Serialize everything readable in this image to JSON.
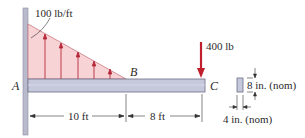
{
  "diagram": {
    "type": "cantilever-beam",
    "support_label": "A",
    "load_end_label": "B",
    "free_end_label": "C",
    "distributed_load": {
      "label": "100 lb/ft",
      "max_at": "A",
      "zero_at": "B"
    },
    "point_load": {
      "label": "400 lb",
      "at": "C",
      "direction": "down"
    },
    "dimensions": {
      "AB": "10 ft",
      "BC": "8 ft"
    },
    "cross_section": {
      "height_label": "8 in. (nom)",
      "width_label": "4 in. (nom)"
    },
    "colors": {
      "load_fill": "#f7d3d6",
      "load_arrow": "#b5283a",
      "point_load_arrow": "#c0202e",
      "beam_fill": "#c6c8dc",
      "beam_stroke": "#6a6d86",
      "wall_fill": "#b9bbcc",
      "dimension_line": "#333333"
    }
  }
}
